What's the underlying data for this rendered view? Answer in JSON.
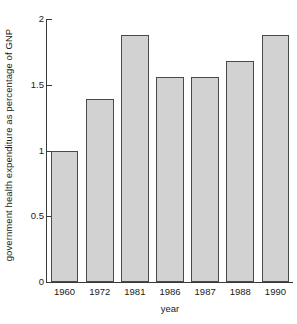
{
  "chart_data": {
    "type": "bar",
    "title": "",
    "subtitle": "",
    "xlabel": "year",
    "ylabel": "government health expenditure as percentage of GNP",
    "categories": [
      "1960",
      "1972",
      "1981",
      "1986",
      "1987",
      "1988",
      "1990"
    ],
    "values": [
      1.0,
      1.39,
      1.88,
      1.56,
      1.56,
      1.68,
      1.88
    ],
    "series": [
      {
        "name": "government health expenditure as percentage of GNP",
        "values": [
          1.0,
          1.39,
          1.88,
          1.56,
          1.56,
          1.68,
          1.88
        ]
      }
    ],
    "ylim": [
      0,
      2
    ],
    "xlim": [
      0,
      7
    ],
    "y_ticks": [
      0,
      0.5,
      1,
      1.5,
      2
    ],
    "y_tick_labels": [
      "0",
      "0.5",
      "1",
      "1.5",
      "2"
    ],
    "x_tick_labels": [
      "1960",
      "1972",
      "1981",
      "1986",
      "1987",
      "1988",
      "1990"
    ],
    "grid": false,
    "legend": null,
    "legend_position": "none",
    "bar_fill_color": "#d2d2d2",
    "bar_border_color": "#4a4a4a",
    "axis_color": "#3a3a3a",
    "background_color": "#ffffff",
    "text_color": "#1a1a1a",
    "annotations": []
  }
}
